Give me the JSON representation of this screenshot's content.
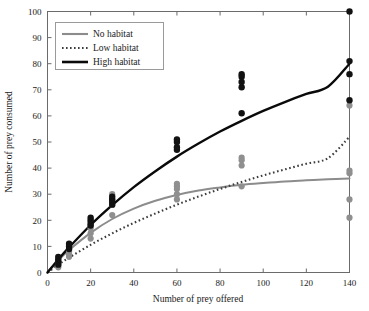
{
  "chart_data": {
    "type": "scatter",
    "title": "",
    "xlabel": "Number of prey offered",
    "ylabel": "Number of prey consumed",
    "xlim": [
      0,
      140
    ],
    "ylim": [
      0,
      100
    ],
    "xticks": [
      0,
      20,
      40,
      60,
      80,
      100,
      120,
      140
    ],
    "yticks": [
      0,
      10,
      20,
      30,
      40,
      50,
      60,
      70,
      80,
      90,
      100
    ],
    "grid": false,
    "frame": "box",
    "legend_position": "top-left",
    "legend": [
      {
        "label": "No habitat",
        "style": "solid",
        "color": "#8c8c8c"
      },
      {
        "label": "Low habitat",
        "style": "dotted",
        "color": "#3c3c3c"
      },
      {
        "label": "High habitat",
        "style": "solid",
        "color": "#0a0a0a"
      }
    ],
    "series": [
      {
        "name": "No habitat",
        "style": "solid",
        "color": "#8c8c8c",
        "curve": [
          [
            0,
            0
          ],
          [
            5,
            4.6
          ],
          [
            10,
            8.6
          ],
          [
            20,
            15.2
          ],
          [
            30,
            20.5
          ],
          [
            40,
            24.5
          ],
          [
            50,
            27.5
          ],
          [
            60,
            29.7
          ],
          [
            70,
            31.4
          ],
          [
            80,
            32.6
          ],
          [
            90,
            33.6
          ],
          [
            100,
            34.3
          ],
          [
            110,
            34.9
          ],
          [
            120,
            35.3
          ],
          [
            130,
            35.7
          ],
          [
            140,
            36.0
          ]
        ],
        "points": [
          [
            5,
            2
          ],
          [
            5,
            3
          ],
          [
            5,
            4
          ],
          [
            10,
            6
          ],
          [
            10,
            7
          ],
          [
            10,
            8
          ],
          [
            10,
            9
          ],
          [
            20,
            13
          ],
          [
            20,
            15
          ],
          [
            20,
            17
          ],
          [
            20,
            18
          ],
          [
            30,
            22
          ],
          [
            30,
            26
          ],
          [
            30,
            28
          ],
          [
            30,
            30
          ],
          [
            60,
            28
          ],
          [
            60,
            30
          ],
          [
            60,
            32
          ],
          [
            60,
            33
          ],
          [
            60,
            34
          ],
          [
            90,
            33
          ],
          [
            90,
            41
          ],
          [
            90,
            43
          ],
          [
            90,
            44
          ],
          [
            140,
            21
          ],
          [
            140,
            28
          ],
          [
            140,
            38
          ],
          [
            140,
            39
          ],
          [
            140,
            64
          ]
        ]
      },
      {
        "name": "Low habitat",
        "style": "dotted",
        "color": "#3c3c3c",
        "curve": [
          [
            0,
            0
          ],
          [
            5,
            3.0
          ],
          [
            10,
            5.7
          ],
          [
            20,
            10.6
          ],
          [
            30,
            15.0
          ],
          [
            40,
            19.0
          ],
          [
            50,
            22.6
          ],
          [
            60,
            26.0
          ],
          [
            70,
            29.1
          ],
          [
            80,
            32.0
          ],
          [
            90,
            34.7
          ],
          [
            100,
            37.2
          ],
          [
            110,
            39.5
          ],
          [
            120,
            41.7
          ],
          [
            130,
            43.8
          ],
          [
            140,
            52.0
          ]
        ],
        "points": []
      },
      {
        "name": "High habitat",
        "style": "solid",
        "color": "#0a0a0a",
        "curve": [
          [
            0,
            0
          ],
          [
            5,
            5.0
          ],
          [
            10,
            9.6
          ],
          [
            20,
            18.2
          ],
          [
            30,
            25.8
          ],
          [
            40,
            32.7
          ],
          [
            50,
            38.8
          ],
          [
            60,
            44.4
          ],
          [
            70,
            49.4
          ],
          [
            80,
            54.0
          ],
          [
            90,
            58.1
          ],
          [
            100,
            61.9
          ],
          [
            110,
            65.3
          ],
          [
            120,
            68.4
          ],
          [
            130,
            71.2
          ],
          [
            140,
            80.0
          ]
        ],
        "points": [
          [
            5,
            3
          ],
          [
            5,
            4
          ],
          [
            5,
            5
          ],
          [
            5,
            6
          ],
          [
            10,
            9
          ],
          [
            10,
            10
          ],
          [
            10,
            11
          ],
          [
            20,
            18
          ],
          [
            20,
            19
          ],
          [
            20,
            20
          ],
          [
            20,
            21
          ],
          [
            30,
            26
          ],
          [
            30,
            27
          ],
          [
            30,
            28
          ],
          [
            30,
            29
          ],
          [
            60,
            47
          ],
          [
            60,
            48
          ],
          [
            60,
            50
          ],
          [
            60,
            51
          ],
          [
            90,
            61
          ],
          [
            90,
            71
          ],
          [
            90,
            73
          ],
          [
            90,
            75
          ],
          [
            90,
            76
          ],
          [
            140,
            66
          ],
          [
            140,
            76
          ],
          [
            140,
            81
          ],
          [
            140,
            100
          ]
        ]
      }
    ]
  },
  "axis": {
    "x_tick_labels": [
      "0",
      "20",
      "40",
      "60",
      "80",
      "100",
      "120",
      "140"
    ],
    "y_tick_labels": [
      "0",
      "10",
      "20",
      "30",
      "40",
      "50",
      "60",
      "70",
      "80",
      "90",
      "100"
    ],
    "x_title": "Number of prey offered",
    "y_title": "Number of prey consumed"
  }
}
